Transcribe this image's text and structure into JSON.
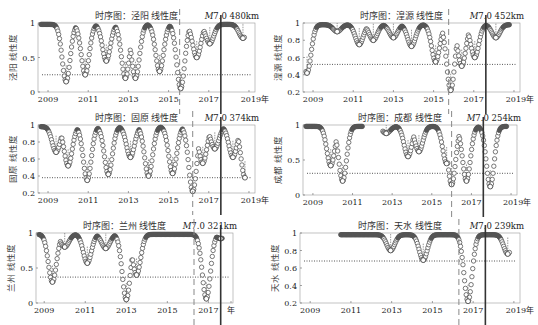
{
  "figure": {
    "year_suffix": "年",
    "marker_color": "#555555",
    "event_line_color": "#333333",
    "dashed_line_color": "#888888"
  },
  "chart_data": [
    {
      "type": "scatter",
      "station": "泾阳",
      "title": "时序图：泾阳 线性度",
      "annotation": "M7.0 480km",
      "ylabel": "泾阳 线性度",
      "xlabel": "年",
      "xticks": [
        "2009",
        "2011",
        "2013",
        "2015",
        "2017",
        "2019年"
      ],
      "xlim": [
        2008.5,
        2019.3
      ],
      "ylim": [
        0,
        1
      ],
      "yticks": [
        0,
        0.5,
        1
      ],
      "threshold": 0.25,
      "event_year": 2017.6,
      "dashed_year": 2015.55,
      "dips": [
        [
          2009.9,
          0.15
        ],
        [
          2010.85,
          0.25
        ],
        [
          2011.9,
          0.45
        ],
        [
          2012.85,
          0.2
        ],
        [
          2013.35,
          0.2
        ],
        [
          2014.55,
          0.3
        ],
        [
          2015.6,
          0.05
        ],
        [
          2016.4,
          0.5
        ],
        [
          2017.05,
          0.7
        ],
        [
          2018.7,
          0.78
        ]
      ],
      "plot": {
        "x0": 38,
        "x1": 255,
        "y0": 23,
        "y1": 92
      }
    },
    {
      "type": "scatter",
      "station": "湟源",
      "title": "时序图：湟源 线性度",
      "annotation": "M7.0 452km",
      "ylabel": "湟源 线性度",
      "xlabel": "年",
      "xticks": [
        "2009",
        "2011",
        "2013",
        "2015",
        "2017",
        "2019年"
      ],
      "xlim": [
        2008.5,
        2019.3
      ],
      "ylim": [
        0.2,
        1
      ],
      "yticks": [
        0.2,
        0.4,
        0.6,
        0.8,
        1
      ],
      "threshold": 0.52,
      "event_year": 2017.6,
      "dashed_year": 2015.75,
      "dips": [
        [
          2008.7,
          0.42
        ],
        [
          2010.2,
          0.9
        ],
        [
          2011.3,
          0.75
        ],
        [
          2012.0,
          0.8
        ],
        [
          2013.0,
          0.83
        ],
        [
          2013.9,
          0.73
        ],
        [
          2015.1,
          0.55
        ],
        [
          2015.85,
          0.22
        ],
        [
          2016.4,
          0.5
        ],
        [
          2017.05,
          0.6
        ],
        [
          2018.1,
          0.83
        ]
      ],
      "plot": {
        "x0": 303,
        "x1": 520,
        "y0": 23,
        "y1": 92
      }
    },
    {
      "type": "scatter",
      "station": "固原",
      "title": "时序图：固原 线性度",
      "annotation": "M7.0 374km",
      "ylabel": "固原 线性度",
      "xlabel": "年",
      "xticks": [
        "2009",
        "2011",
        "2013",
        "2015",
        "2017",
        "2019年"
      ],
      "xlim": [
        2008.5,
        2019.3
      ],
      "ylim": [
        0.2,
        1
      ],
      "yticks": [
        0.2,
        0.4,
        0.6,
        0.8,
        1
      ],
      "threshold": 0.38,
      "event_year": 2017.6,
      "dashed_year": 2016.2,
      "dips": [
        [
          2009.4,
          0.68
        ],
        [
          2010.0,
          0.52
        ],
        [
          2010.95,
          0.35
        ],
        [
          2012.0,
          0.42
        ],
        [
          2013.1,
          0.62
        ],
        [
          2014.0,
          0.4
        ],
        [
          2015.2,
          0.43
        ],
        [
          2016.2,
          0.22
        ],
        [
          2016.7,
          0.55
        ],
        [
          2017.3,
          0.72
        ],
        [
          2018.2,
          0.62
        ],
        [
          2018.8,
          0.38
        ]
      ],
      "plot": {
        "x0": 38,
        "x1": 255,
        "y0": 125,
        "y1": 193
      }
    },
    {
      "type": "scatter",
      "station": "成都",
      "title": "时序图：成都 线性度",
      "annotation": "M7.0 254km",
      "ylabel": "成都 线性度",
      "xlabel": "年",
      "xticks": [
        "2009",
        "2011",
        "2013",
        "2015",
        "2017",
        "2019年"
      ],
      "xlim": [
        2008.5,
        2019.3
      ],
      "ylim": [
        0,
        1
      ],
      "yticks": [
        0,
        0.5,
        1
      ],
      "threshold": 0.31,
      "event_year": 2017.6,
      "dashed_year": 2016.0,
      "gap": [
        2011.5,
        2012.5
      ],
      "dips": [
        [
          2009.9,
          0.42
        ],
        [
          2010.5,
          0.2
        ],
        [
          2012.7,
          0.88
        ],
        [
          2013.8,
          0.55
        ],
        [
          2014.35,
          0.62
        ],
        [
          2015.75,
          0.45
        ],
        [
          2016.0,
          0.15
        ],
        [
          2016.75,
          0.2
        ],
        [
          2017.95,
          0.12
        ]
      ],
      "plot": {
        "x0": 303,
        "x1": 517,
        "y0": 125,
        "y1": 195
      }
    },
    {
      "type": "scatter",
      "station": "兰州",
      "title": "时序图：兰州 线性度",
      "annotation": "M7.0 321km",
      "ylabel": "兰州 线性度",
      "xlabel": "年",
      "xticks": [
        "2009",
        "2011",
        "2013",
        "2015",
        "2017",
        "年"
      ],
      "xlim": [
        2008.6,
        2018.2
      ],
      "ylim": [
        0,
        1
      ],
      "yticks": [
        0,
        0.5,
        1
      ],
      "threshold": 0.37,
      "event_year": 2017.6,
      "dashed_year": 2016.3,
      "dips": [
        [
          2009.4,
          0.3
        ],
        [
          2010.0,
          0.8
        ],
        [
          2011.1,
          0.57
        ],
        [
          2012.0,
          0.78
        ],
        [
          2013.0,
          0.05
        ],
        [
          2013.5,
          0.4
        ],
        [
          2016.9,
          0.06
        ],
        [
          2017.6,
          0.92
        ]
      ],
      "plot": {
        "x0": 36,
        "x1": 233,
        "y0": 233,
        "y1": 303
      }
    },
    {
      "type": "scatter",
      "station": "天水",
      "title": "时序图：天水 线性度",
      "annotation": "M7.0 239km",
      "ylabel": "天水 线性度",
      "xlabel": "年",
      "xticks": [
        "2009",
        "2011",
        "2013",
        "2015",
        "2017",
        "2019年"
      ],
      "xlim": [
        2008.5,
        2019.3
      ],
      "ylim": [
        0.2,
        1
      ],
      "yticks": [
        0.2,
        0.4,
        0.6,
        0.8,
        1
      ],
      "threshold": 0.68,
      "event_year": 2017.6,
      "dashed_year": 2016.3,
      "start_year": 2010.5,
      "dips": [
        [
          2012.95,
          0.8
        ],
        [
          2014.55,
          0.69
        ],
        [
          2016.75,
          0.22
        ],
        [
          2018.7,
          0.76
        ]
      ],
      "plot": {
        "x0": 300,
        "x1": 520,
        "y0": 233,
        "y1": 303
      }
    }
  ]
}
